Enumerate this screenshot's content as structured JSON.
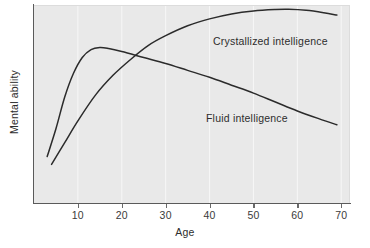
{
  "chart_data": {
    "type": "line",
    "title": "",
    "xlabel": "Age",
    "ylabel": "Mental ability",
    "xlim": [
      0,
      72
    ],
    "ylim": [
      0,
      100
    ],
    "xticks": [
      10,
      20,
      30,
      40,
      50,
      60,
      70
    ],
    "xticklabels": [
      "10",
      "20",
      "30",
      "40",
      "50",
      "60",
      "70"
    ],
    "yticks": [],
    "yticklabels": [],
    "grid": "vertical-only",
    "legend_position": "inline-annotations",
    "background_color": "#e9e9e9",
    "line_color": "#2b2b2b",
    "series": [
      {
        "name": "Fluid intelligence",
        "label_x": 32,
        "label_y": 46,
        "x": [
          3,
          5,
          7,
          9,
          11,
          13,
          15,
          17,
          20,
          25,
          30,
          35,
          40,
          45,
          50,
          55,
          60,
          65,
          69
        ],
        "values": [
          24,
          38,
          54,
          66,
          74,
          78,
          79,
          78.5,
          77,
          74,
          71,
          67.5,
          64,
          60,
          56,
          51.5,
          47,
          43,
          40
        ]
      },
      {
        "name": "Crystallized intelligence",
        "label_x": 41,
        "label_y": 84,
        "x": [
          4,
          7,
          10,
          14,
          18,
          22,
          26,
          30,
          35,
          40,
          45,
          50,
          55,
          58,
          62,
          66,
          69
        ],
        "values": [
          20,
          31,
          42,
          55,
          65,
          73,
          80,
          85,
          90,
          93.5,
          96,
          97.5,
          98.2,
          98.3,
          97.8,
          96.6,
          95.4
        ]
      }
    ]
  },
  "axis": {
    "x_title": "Age",
    "y_title": "Mental ability"
  },
  "annotations": {
    "crystallized": "Crystallized intelligence",
    "fluid": "Fluid intelligence"
  }
}
